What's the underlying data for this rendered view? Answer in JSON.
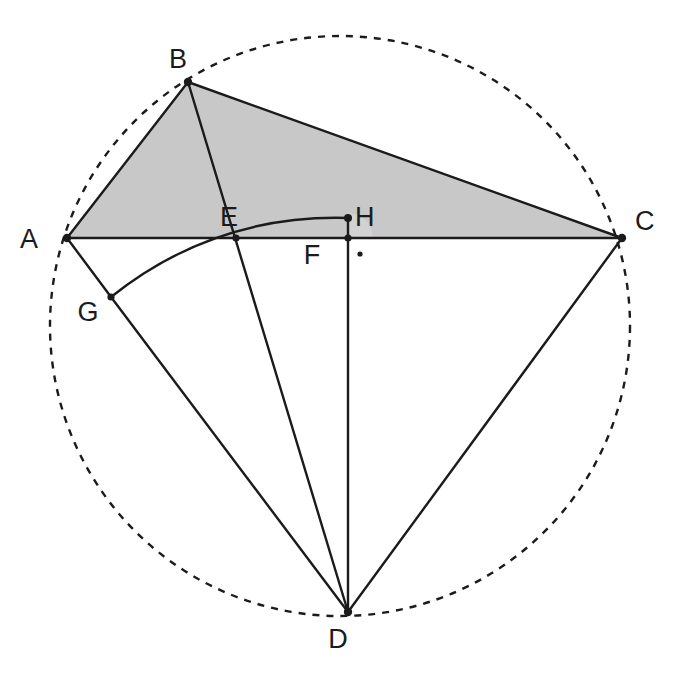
{
  "figure": {
    "background_color": "#ffffff",
    "stroke_color": "#1b1b1b",
    "shaded_fill": "#c8c8c8",
    "angle_marker_fill": "#d2d2d2",
    "canvas": {
      "width": 676,
      "height": 684
    }
  },
  "circle": {
    "name": "circumcircle",
    "center": {
      "x": 340,
      "y": 326
    },
    "radius": 290,
    "style": "dashed",
    "dash_pattern": "7 7",
    "stroke_width": 2.4,
    "fill": "none"
  },
  "points": {
    "A": {
      "label": "A",
      "x": 67,
      "y": 238,
      "label_x": 38,
      "label_y": 248,
      "dot": true
    },
    "B": {
      "label": "B",
      "x": 188,
      "y": 82,
      "label_x": 178,
      "label_y": 68,
      "dot": true
    },
    "C": {
      "label": "C",
      "x": 622,
      "y": 238,
      "label_x": 635,
      "label_y": 230,
      "dot": true
    },
    "D": {
      "label": "D",
      "x": 348,
      "y": 612,
      "label_x": 338,
      "label_y": 648,
      "dot": true
    },
    "E": {
      "label": "E",
      "x": 236,
      "y": 238,
      "label_x": 229,
      "label_y": 226,
      "dot": true
    },
    "F": {
      "label": "F",
      "x": 348,
      "y": 238,
      "label_x": 312,
      "label_y": 264,
      "dot": true
    },
    "G": {
      "label": "G",
      "x": 111,
      "y": 297,
      "label_x": 88,
      "label_y": 321,
      "dot": true
    },
    "H": {
      "label": "H",
      "x": 348,
      "y": 218,
      "label_x": 355,
      "label_y": 226,
      "dot": true
    }
  },
  "shaded_region": {
    "name": "triangle-abc-fill",
    "vertices": [
      "A",
      "B",
      "C"
    ],
    "points_attr": "67,238 188,82 622,238",
    "fill": "#c8c8c8"
  },
  "segments": [
    {
      "name": "segment-ab",
      "from": "A",
      "to": "B",
      "d": "M 67 238 L 188 82"
    },
    {
      "name": "segment-bc",
      "from": "B",
      "to": "C",
      "d": "M 188 82 L 622 238"
    },
    {
      "name": "segment-ac",
      "from": "A",
      "to": "C",
      "d": "M 67 238 L 622 238"
    },
    {
      "name": "segment-bd",
      "from": "B",
      "to": "D",
      "d": "M 188 82 L 348 612"
    },
    {
      "name": "segment-ag",
      "from": "A",
      "to": "G",
      "d": "M 67 238 L 111 297"
    },
    {
      "name": "segment-gd",
      "from": "G",
      "to": "D",
      "d": "M 111 297 L 348 612"
    },
    {
      "name": "segment-cd",
      "from": "C",
      "to": "D",
      "d": "M 622 238 L 348 612"
    },
    {
      "name": "segment-fd",
      "from": "F",
      "to": "D",
      "d": "M 348 238 L 348 612"
    },
    {
      "name": "segment-fh",
      "from": "F",
      "to": "H",
      "d": "M 348 238 L 348 218"
    }
  ],
  "arc": {
    "name": "arc-geh",
    "description": "circular arc centered at D passing through G, E and H",
    "center": "D",
    "from": "G",
    "through": "E",
    "to": "H",
    "d": "M 111 297 Q 215 214 348 218",
    "stroke_width": 2.4
  },
  "angle_marker": {
    "name": "angle-marker-at-f",
    "at": "F",
    "radius": 25,
    "fill": "#d2d2d2",
    "d": "M 373 238 A 25 25 0 0 0 348 213 L 348 238 Z",
    "dot": {
      "x": 360,
      "y": 254,
      "r": 2.6
    }
  },
  "labels_order": [
    "A",
    "B",
    "C",
    "D",
    "E",
    "F",
    "G",
    "H"
  ]
}
